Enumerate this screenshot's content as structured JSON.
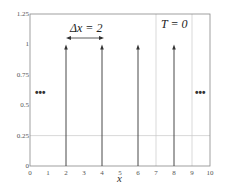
{
  "chart_data": {
    "type": "line",
    "title": "",
    "xlabel": "x",
    "ylabel": "",
    "xlim": [
      0,
      10
    ],
    "ylim": [
      0,
      1.25
    ],
    "x_ticks": [
      "0",
      "1",
      "2",
      "3",
      "4",
      "5",
      "6",
      "7",
      "8",
      "9",
      "10"
    ],
    "y_ticks": [
      "0",
      "0.25",
      "0.5",
      "0.75",
      "1",
      "1.25"
    ],
    "grid": {
      "vertical": [
        7,
        9
      ],
      "horizontal": [
        0.25
      ]
    },
    "series": [
      {
        "name": "impulse train (Dirac deltas)",
        "x": [
          2,
          4,
          6,
          8
        ],
        "values": [
          1,
          1,
          1,
          1
        ]
      }
    ],
    "annotations": [
      {
        "text": "Δx = 2",
        "x": 3,
        "y": 1.1,
        "type": "double-arrow",
        "from": 2,
        "to": 4
      },
      {
        "text": "T = 0",
        "x": 8,
        "y": 1.15
      },
      {
        "text": "•••",
        "x": 0.5,
        "y": 0.6
      },
      {
        "text": "•••",
        "x": 9.5,
        "y": 0.6
      }
    ]
  },
  "labels": {
    "xlabel": "x",
    "delta_x": "Δx = 2",
    "time": "T = 0",
    "ellipsis_left": "•••",
    "ellipsis_right": "•••"
  }
}
